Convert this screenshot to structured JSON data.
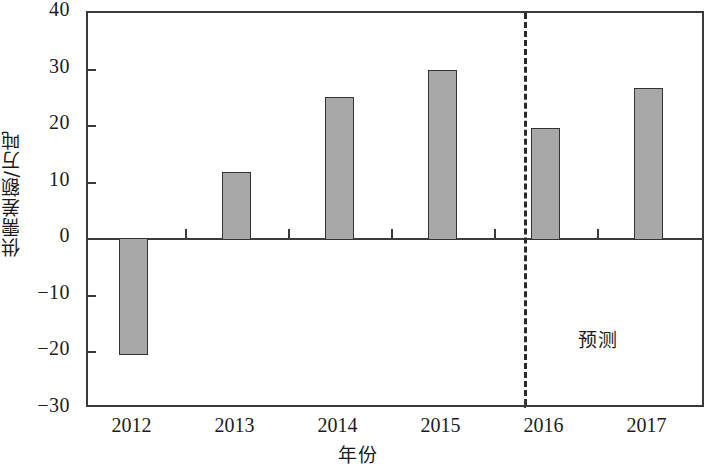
{
  "chart_data": {
    "type": "bar",
    "title": "",
    "xlabel": "年份",
    "ylabel": "供需差额/万吨",
    "categories": [
      "2012",
      "2013",
      "2014",
      "2015",
      "2016",
      "2017"
    ],
    "values": [
      -20.2,
      11.8,
      25.0,
      29.7,
      19.5,
      26.5
    ],
    "series": [
      {
        "name": "供需差额",
        "values": [
          -20.2,
          11.8,
          25.0,
          29.7,
          19.5,
          26.5
        ]
      }
    ],
    "ylim": [
      -30,
      40
    ],
    "ytick_labels": [
      "40",
      "30",
      "20",
      "10",
      "0",
      "-10",
      "-20",
      "-30"
    ],
    "ytick_values": [
      40,
      30,
      20,
      10,
      0,
      -10,
      -20,
      -30
    ],
    "xtick_labels": [
      "2012",
      "2013",
      "2014",
      "2015",
      "2016",
      "2017"
    ],
    "grid": false,
    "legend": false,
    "legend_position": "none",
    "annotations": [
      {
        "text": "预测",
        "x_category": "2016-2017",
        "y_value": -15,
        "note": "forecast region label, right of dashed divider"
      }
    ],
    "divider": {
      "type": "dashed-vertical",
      "between": [
        "2015",
        "2016"
      ],
      "label": "预测"
    },
    "colors": {
      "bar_fill": "#a8a8a8",
      "bar_stroke": "#333333",
      "axis": "#3b3b3b",
      "text": "#1b1b1b",
      "background": "#ffffff"
    }
  }
}
